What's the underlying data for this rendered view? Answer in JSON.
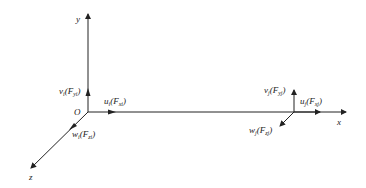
{
  "axes": {
    "x": "x",
    "y": "y",
    "z": "z",
    "origin": "O"
  },
  "node_i": {
    "v": {
      "main": "v",
      "sub1": "i",
      "force": "F",
      "sub2": "yi"
    },
    "u": {
      "main": "u",
      "sub1": "i",
      "force": "F",
      "sub2": "xi"
    },
    "w": {
      "main": "w",
      "sub1": "i",
      "force": "F",
      "sub2": "zi"
    }
  },
  "node_j": {
    "v": {
      "main": "v",
      "sub1": "j",
      "force": "F",
      "sub2": "yj"
    },
    "u": {
      "main": "u",
      "sub1": "j",
      "force": "F",
      "sub2": "xj"
    },
    "w": {
      "main": "w",
      "sub1": "j",
      "force": "F",
      "sub2": "zj"
    }
  },
  "colors": {
    "line": "#222222",
    "background": "#ffffff"
  }
}
